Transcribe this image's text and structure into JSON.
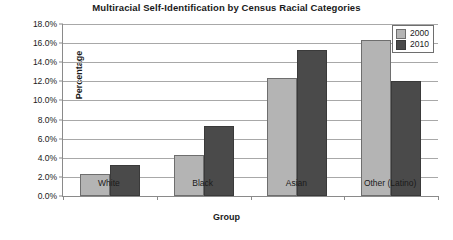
{
  "chart_data": {
    "type": "bar",
    "title": "Multiracial Self-Identification by Census Racial Categories",
    "xlabel": "Group",
    "ylabel": "Percentage",
    "categories": [
      "White",
      "Black",
      "Asian",
      "Other (Latino)"
    ],
    "series": [
      {
        "name": "2000",
        "color": "#b4b4b4",
        "values": [
          2.3,
          4.3,
          12.3,
          16.3
        ]
      },
      {
        "name": "2010",
        "color": "#4a4a4a",
        "values": [
          3.2,
          7.3,
          15.3,
          12.0
        ]
      }
    ],
    "ylim": [
      0,
      18
    ],
    "ytick_values": [
      0,
      2,
      4,
      6,
      8,
      10,
      12,
      14,
      16,
      18
    ],
    "ytick_labels": [
      "0.0%",
      "2.0%",
      "4.0%",
      "6.0%",
      "8.0%",
      "10.0%",
      "12.0%",
      "14.0%",
      "16.0%",
      "18.0%"
    ],
    "grid": true,
    "legend_position": "top-right"
  }
}
